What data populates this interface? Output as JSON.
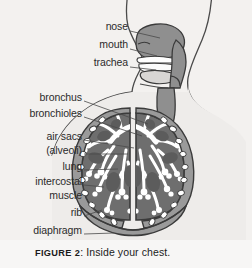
{
  "figure": {
    "caption_number": "FIGURE 2",
    "caption_text": ": Inside your chest.",
    "background_color": "#f3f1ef",
    "caption_band_color": "#f7f6f5"
  },
  "diagram": {
    "title_subject": "human respiratory system cross-section",
    "view": "sagittal head and frontal chest composite",
    "palette": {
      "outline": "#3b3b3b",
      "airway_fill": "#8f8f8f",
      "lung_fill": "#6e6e6e",
      "bronchial_tree_fill": "#ffffff",
      "chest_wall_fill": "#9a9a9a",
      "rib_fill": "#ffffff",
      "body_fill": "#f3f1ef",
      "tongue_fill": "#d8d6d4"
    },
    "labels": [
      {
        "id": "nose",
        "text": "nose",
        "x": 60,
        "y": 26,
        "right": 128,
        "leader_to_x": 160,
        "leader_to_y": 34
      },
      {
        "id": "mouth",
        "text": "mouth",
        "x": 60,
        "y": 44,
        "right": 128,
        "leader_to_x": 158,
        "leader_to_y": 52
      },
      {
        "id": "trachea",
        "text": "trachea",
        "x": 60,
        "y": 62,
        "right": 128,
        "leader_to_x": 156,
        "leader_to_y": 68
      },
      {
        "id": "bronchus",
        "text": "bronchus",
        "x": 14,
        "y": 97,
        "right": 82,
        "leader_to_x": 146,
        "leader_to_y": 122
      },
      {
        "id": "bronchioles",
        "text": "bronchioles",
        "x": 8,
        "y": 113,
        "right": 82,
        "leader_to_x": 140,
        "leader_to_y": 134
      },
      {
        "id": "air-sacs",
        "text": "air sacs",
        "x": 22,
        "y": 136,
        "right": 82,
        "leader_to_x": 132,
        "leader_to_y": 146
      },
      {
        "id": "alveoli",
        "text": "(alveoli)",
        "x": 22,
        "y": 150,
        "right": 82,
        "leader_to_x": 128,
        "leader_to_y": 152
      },
      {
        "id": "lung",
        "text": "lung",
        "x": 38,
        "y": 166,
        "right": 82,
        "leader_to_x": 118,
        "leader_to_y": 168
      },
      {
        "id": "intercostal",
        "text": "intercostal",
        "x": 10,
        "y": 181,
        "right": 82,
        "leader_to_x": 104,
        "leader_to_y": 186
      },
      {
        "id": "muscle",
        "text": "muscle",
        "x": 28,
        "y": 195,
        "right": 82,
        "leader_to_x": 104,
        "leader_to_y": 190
      },
      {
        "id": "rib",
        "text": "rib",
        "x": 52,
        "y": 212,
        "right": 82,
        "leader_to_x": 102,
        "leader_to_y": 208
      },
      {
        "id": "diaphragm",
        "text": "diaphragm",
        "x": 14,
        "y": 230,
        "right": 82,
        "leader_to_x": 112,
        "leader_to_y": 232
      }
    ]
  }
}
